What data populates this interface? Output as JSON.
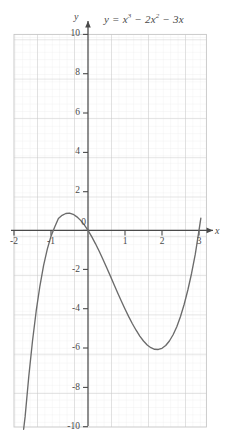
{
  "figure": {
    "equation_text": "y = x3 − 2x2 − 3x",
    "equation_parts": {
      "lhs": "y",
      "equals": "=",
      "term1_base": "x",
      "term1_exp": "3",
      "minus1": "−",
      "term2_coef": "2",
      "term2_base": "x",
      "term2_exp": "2",
      "minus2": "−",
      "term3": "3x"
    },
    "x_axis_name": "x",
    "y_axis_name": "y",
    "background_color": "#ffffff",
    "curve_color": "#6b6b6b",
    "axis_color": "#4a4a4a",
    "major_grid_color": "#c9c9c9",
    "minor_grid_color": "#e8e8e8"
  },
  "chart_data": {
    "type": "line",
    "xlabel": "x",
    "ylabel": "y",
    "xlim": [
      -2,
      3
    ],
    "ylim": [
      -10,
      10
    ],
    "xticks": [
      -2,
      -1,
      0,
      1,
      2,
      3
    ],
    "yticks": [
      -10,
      -8,
      -6,
      -4,
      -2,
      0,
      2,
      4,
      6,
      8,
      10
    ],
    "xtick_labels": [
      "-2",
      "-1",
      "0",
      "1",
      "2",
      "3"
    ],
    "ytick_labels": [
      "-10",
      "-8",
      "-6",
      "-4",
      "-2",
      "0",
      "2",
      "4",
      "6",
      "8",
      "10"
    ],
    "grid": true,
    "minor_grid": true,
    "minor_ticks_per_unit": 5,
    "legend": false,
    "function": "y = x^3 - 2x^2 - 3x",
    "roots": [
      -1,
      0,
      3
    ],
    "local_maximum": {
      "x": -0.5486,
      "y": 1.6311
    },
    "local_minimum": {
      "x": 1.8153,
      "y": -6.0608
    },
    "series": [
      {
        "name": "y = x^3 - 2x^2 - 3x",
        "x": [
          -1.74,
          -1.7,
          -1.6,
          -1.5,
          -1.4,
          -1.3,
          -1.2,
          -1.1,
          -1.0,
          -0.9,
          -0.8,
          -0.7,
          -0.6,
          -0.5,
          -0.4,
          -0.3,
          -0.2,
          -0.1,
          0.0,
          0.1,
          0.2,
          0.3,
          0.4,
          0.5,
          0.6,
          0.7,
          0.8,
          0.9,
          1.0,
          1.1,
          1.2,
          1.3,
          1.4,
          1.5,
          1.6,
          1.7,
          1.8,
          1.9,
          2.0,
          2.1,
          2.2,
          2.3,
          2.4,
          2.5,
          2.6,
          2.7,
          2.8,
          2.9,
          3.0,
          3.05
        ],
        "values": [
          -10.12,
          -9.49,
          -7.42,
          -5.63,
          -4.1,
          -2.83,
          -1.78,
          -0.95,
          -0.3,
          0.17,
          0.61,
          0.77,
          0.86,
          0.88,
          0.82,
          0.69,
          0.51,
          0.28,
          0.0,
          -0.32,
          -0.67,
          -1.05,
          -1.46,
          -1.88,
          -2.3,
          -2.74,
          -3.17,
          -3.59,
          -4.0,
          -4.39,
          -4.75,
          -5.08,
          -5.38,
          -5.63,
          -5.83,
          -5.97,
          -6.05,
          -6.06,
          -6.0,
          -5.86,
          -5.63,
          -5.31,
          -4.9,
          -4.38,
          -3.76,
          -3.02,
          -2.18,
          -1.21,
          0.0,
          0.62
        ]
      }
    ]
  }
}
